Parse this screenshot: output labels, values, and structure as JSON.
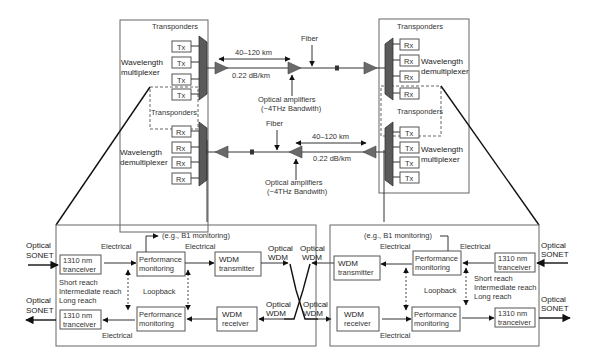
{
  "top": {
    "left_terminal": {
      "upper_group": {
        "title": "Transponders",
        "mux_label": [
          "Wavelength",
          "multiplexer"
        ],
        "units": [
          "Tx",
          "Tx",
          "Tx",
          "Tx"
        ]
      },
      "lower_group": {
        "title": "Transponders",
        "mux_label": [
          "Wavelength",
          "demultiplexer"
        ],
        "units": [
          "Rx",
          "Rx",
          "Rx",
          "Rx"
        ]
      }
    },
    "right_terminal": {
      "upper_group": {
        "title": "Transponders",
        "mux_label": [
          "Wavelength",
          "demultiplexer"
        ],
        "units": [
          "Rx",
          "Rx",
          "Rx",
          "Rx"
        ]
      },
      "lower_group": {
        "title": "Transponders",
        "mux_label": [
          "Wavelength",
          "multiplexer"
        ],
        "units": [
          "Tx",
          "Tx",
          "Tx",
          "Tx"
        ]
      }
    },
    "link_upper": {
      "span": "40–120 km",
      "loss": "0.22 dB/km",
      "fiber": "Fiber",
      "amplifiers": [
        "Optical amplifiers",
        "(~4THz Bandwith)"
      ]
    },
    "link_lower": {
      "span": "40–120 km",
      "loss": "0.22 dB/km",
      "fiber": "Fiber",
      "amplifiers": [
        "Optical amplifiers",
        "(~4THz Bandwith)"
      ]
    }
  },
  "bottom": {
    "left": {
      "monitor_note": "(e.g., B1 monitoring)",
      "optical_sonet_in": [
        "Optical",
        "SONET"
      ],
      "optical_sonet_out": [
        "Optical",
        "SONET"
      ],
      "tx_transceiver": [
        "1310 nm",
        "tranceiver"
      ],
      "rx_transceiver": [
        "1310 nm",
        "tranceiver"
      ],
      "reach": [
        "Short reach",
        "Intermediate reach",
        "Long reach"
      ],
      "perf_upper": [
        "Performance",
        "monitoring"
      ],
      "perf_lower": [
        "Performance",
        "monitoring"
      ],
      "electrical_1": "Electrical",
      "electrical_2": "Electrical",
      "electrical_3": "Electrical",
      "loopback": "Loopback",
      "wdm_tx": [
        "WDM",
        "transmitter"
      ],
      "wdm_rx": [
        "WDM",
        "receiver"
      ]
    },
    "cross": {
      "left_top": [
        "Optical",
        "WDM"
      ],
      "right_top": [
        "Optical",
        "WDM"
      ],
      "left_bottom": [
        "Optical",
        "WDM"
      ],
      "right_bottom": [
        "Optical",
        "WDM"
      ]
    },
    "right": {
      "monitor_note": "(e.g., B1 monitoring)",
      "optical_sonet_in": [
        "Optical",
        "SONET"
      ],
      "optical_sonet_out": [
        "Optical",
        "SONET"
      ],
      "tx_transceiver": [
        "1310 nm",
        "tranceiver"
      ],
      "rx_transceiver": [
        "1310 nm",
        "tranceiver"
      ],
      "reach": [
        "Short reach",
        "Intermediate reach",
        "Long reach"
      ],
      "perf_upper": [
        "Performance",
        "monitoring"
      ],
      "perf_lower": [
        "Performance",
        "monitoring"
      ],
      "electrical_1": "Electrical",
      "electrical_2": "Electrical",
      "electrical_3": "Electrical",
      "loopback": "Loopback",
      "wdm_tx": [
        "WDM",
        "transmitter"
      ],
      "wdm_rx": [
        "WDM",
        "receiver"
      ]
    }
  }
}
